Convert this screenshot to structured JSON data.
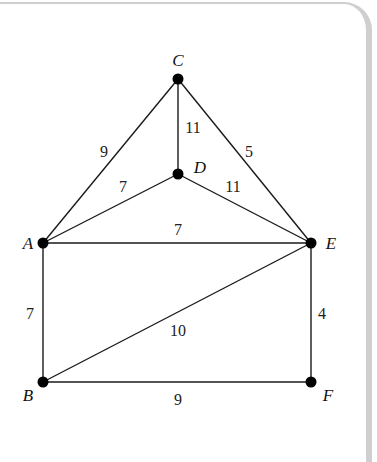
{
  "diagram": {
    "type": "weighted-undirected-graph",
    "nodes": [
      {
        "id": "A",
        "label": "A",
        "x": 43,
        "y": 243,
        "lx": 28,
        "ly": 249
      },
      {
        "id": "B",
        "label": "B",
        "x": 43,
        "y": 382,
        "lx": 28,
        "ly": 401
      },
      {
        "id": "C",
        "label": "C",
        "x": 178,
        "y": 79,
        "lx": 178,
        "ly": 66
      },
      {
        "id": "D",
        "label": "D",
        "x": 178,
        "y": 174,
        "lx": 200,
        "ly": 173
      },
      {
        "id": "E",
        "label": "E",
        "x": 311,
        "y": 243,
        "lx": 331,
        "ly": 249
      },
      {
        "id": "F",
        "label": "F",
        "x": 311,
        "y": 382,
        "lx": 328,
        "ly": 401
      }
    ],
    "edges": [
      {
        "from": "C",
        "to": "A",
        "weight": "9",
        "lx": 104,
        "ly": 157
      },
      {
        "from": "C",
        "to": "D",
        "weight": "11",
        "lx": 193,
        "ly": 133
      },
      {
        "from": "C",
        "to": "E",
        "weight": "5",
        "lx": 249,
        "ly": 157
      },
      {
        "from": "A",
        "to": "D",
        "weight": "7",
        "lx": 123,
        "ly": 192
      },
      {
        "from": "D",
        "to": "E",
        "weight": "11",
        "lx": 233,
        "ly": 192
      },
      {
        "from": "A",
        "to": "E",
        "weight": "7",
        "lx": 178,
        "ly": 235
      },
      {
        "from": "A",
        "to": "B",
        "weight": "7",
        "lx": 30,
        "ly": 319
      },
      {
        "from": "B",
        "to": "E",
        "weight": "10",
        "lx": 178,
        "ly": 336
      },
      {
        "from": "E",
        "to": "F",
        "weight": "4",
        "lx": 322,
        "ly": 319
      },
      {
        "from": "B",
        "to": "F",
        "weight": "9",
        "lx": 178,
        "ly": 405
      }
    ]
  },
  "colors": {
    "edge": "#1a1a1a",
    "node": "#000000",
    "frame": "#cfcfcf",
    "background": "#ffffff"
  }
}
